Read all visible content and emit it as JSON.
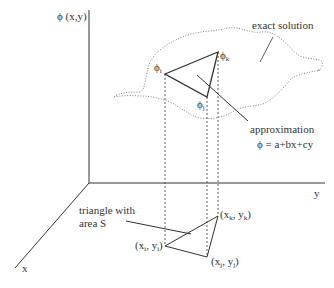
{
  "axes": {
    "vertical_label": "ϕ (x,y)",
    "y_label": "y",
    "x_label": "x"
  },
  "surface": {
    "exact_solution_label": "exact solution"
  },
  "upper_triangle": {
    "vertex_i": {
      "base": "ϕ",
      "sub": "i"
    },
    "vertex_j": {
      "base": "ϕ",
      "sub": "j"
    },
    "vertex_k": {
      "base": "ϕ",
      "sub": "k"
    },
    "approx_label": "approximation",
    "approx_formula": "ϕ = a+bx+cy"
  },
  "lower_triangle": {
    "label_line1": "triangle with",
    "label_line2": "area S",
    "vertex_i": {
      "open": "(x",
      "s1": "i",
      "mid": ", y",
      "s2": "i",
      "close": ")"
    },
    "vertex_j": {
      "open": "(x",
      "s1": "j",
      "mid": ", y",
      "s2": "j",
      "close": ")"
    },
    "vertex_k": {
      "open": "(x",
      "s1": "k",
      "mid": ", y",
      "s2": "k",
      "close": ")"
    }
  },
  "colors": {
    "line": "#333333",
    "dotted": "#777777"
  }
}
